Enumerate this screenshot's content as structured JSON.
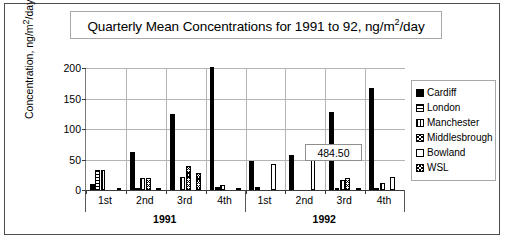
{
  "chart_data": {
    "type": "bar",
    "title": "Quarterly Mean Concentrations for 1991 to 92, ng/m2/day",
    "title_parts": {
      "before_sup": "Quarterly Mean Concentrations for 1991 to 92, ng/m",
      "sup": "2",
      "after_sup": "/day"
    },
    "xlabel": "",
    "ylabel": "Concentration, ng/m2/day",
    "ylabel_parts": {
      "before_sup": "Concentration, ng/m",
      "sup": "2",
      "after_sup": "/day"
    },
    "ylim": [
      0,
      200
    ],
    "yticks": [
      0,
      50,
      100,
      150,
      200
    ],
    "ytick_labels": [
      "0",
      "50",
      "100",
      "150",
      "200"
    ],
    "grid": true,
    "grid_axis": "both",
    "legend_position": "right",
    "categories": [
      "1st",
      "2nd",
      "3rd",
      "4th",
      "1st",
      "2nd",
      "3rd",
      "4th"
    ],
    "group_labels": [
      "1991",
      "1992"
    ],
    "group_spans": [
      4,
      4
    ],
    "series": [
      {
        "name": "Cardiff",
        "pattern": "solid-black",
        "values": [
          10,
          63,
          125,
          484.5,
          47,
          57,
          128,
          168
        ]
      },
      {
        "name": "London",
        "pattern": "horizontal-lines",
        "values": [
          32,
          4,
          0,
          5,
          5,
          0,
          3,
          3
        ]
      },
      {
        "name": "Manchester",
        "pattern": "vertical-lines",
        "values": [
          33,
          20,
          21,
          9,
          0,
          0,
          17,
          11
        ]
      },
      {
        "name": "Middlesbrough",
        "pattern": "cross-hatch",
        "values": [
          0,
          20,
          40,
          0,
          0,
          0,
          19,
          0
        ]
      },
      {
        "name": "Bowland",
        "pattern": "white-empty",
        "values": [
          0,
          0,
          0,
          0,
          43,
          51,
          0,
          22
        ]
      },
      {
        "name": "WSL",
        "pattern": "dense-cross-hatch",
        "values": [
          2,
          4,
          28,
          3,
          0,
          0,
          2,
          0
        ]
      }
    ],
    "annotations": [
      {
        "text": "484.50",
        "note": "value label for clipped Cardiff bar in 1991 4th quarter",
        "target_category_index": 3,
        "target_series": "Cardiff"
      }
    ]
  }
}
